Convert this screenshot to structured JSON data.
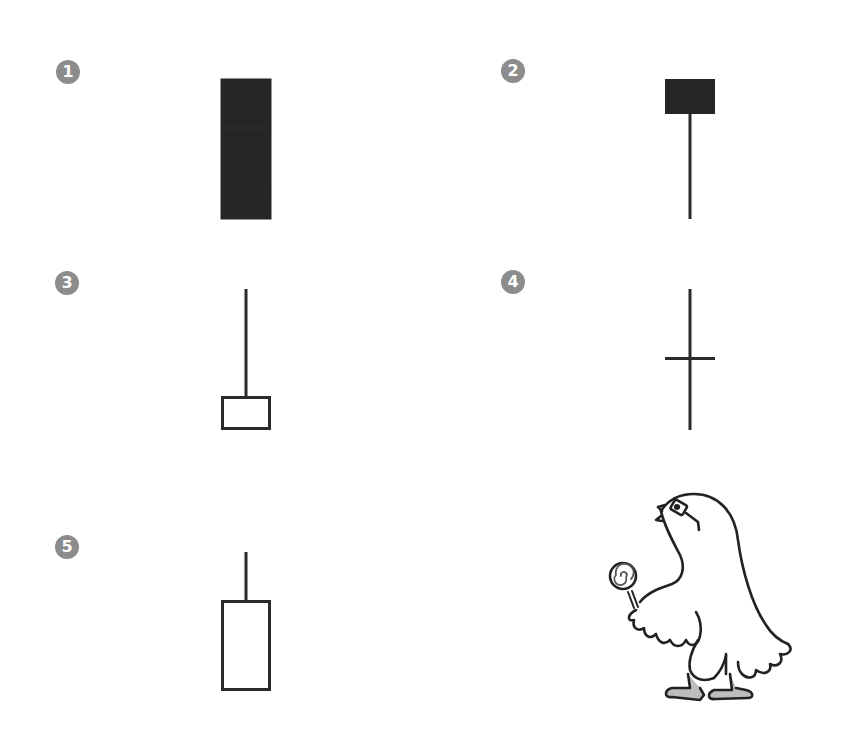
{
  "diagram": {
    "type": "candlestick-patterns",
    "stroke_color": "#2a2a2a",
    "filled_color": "#262626",
    "badge_color": "#8c8c8c",
    "items": [
      {
        "number": "1",
        "kind": "filled-body-no-wicks",
        "badge": {
          "x": 56,
          "y": 60
        },
        "body": {
          "x": 221,
          "y": 79,
          "w": 50,
          "h": 140,
          "filled": true
        },
        "upper_wick": null,
        "lower_wick": null
      },
      {
        "number": "2",
        "kind": "filled-body-long-lower-wick",
        "badge": {
          "x": 501,
          "y": 59
        },
        "body": {
          "x": 665,
          "y": 79,
          "w": 50,
          "h": 35,
          "filled": true
        },
        "upper_wick": null,
        "lower_wick": {
          "x": 690,
          "y1": 114,
          "y2": 219
        }
      },
      {
        "number": "3",
        "kind": "hollow-body-long-upper-wick",
        "badge": {
          "x": 55,
          "y": 271
        },
        "body": {
          "x": 221,
          "y": 396,
          "w": 50,
          "h": 34,
          "filled": false
        },
        "upper_wick": {
          "x": 246,
          "y1": 289,
          "y2": 396
        },
        "lower_wick": null
      },
      {
        "number": "4",
        "kind": "doji-cross",
        "badge": {
          "x": 501,
          "y": 270
        },
        "body": {
          "x": 665,
          "y": 358,
          "w": 50,
          "h": 0,
          "filled": false
        },
        "upper_wick": {
          "x": 690,
          "y1": 289,
          "y2": 358
        },
        "lower_wick": {
          "x": 690,
          "y1": 358,
          "y2": 430
        }
      },
      {
        "number": "5",
        "kind": "hollow-body-short-upper-wick",
        "badge": {
          "x": 55,
          "y": 535
        },
        "body": {
          "x": 221,
          "y": 600,
          "w": 50,
          "h": 91,
          "filled": false
        },
        "upper_wick": {
          "x": 246,
          "y1": 552,
          "y2": 600
        },
        "lower_wick": null
      }
    ],
    "illustration": {
      "subject": "cartoon bird wearing glasses holding a lollipop",
      "icon": "bird-with-lollipop"
    }
  }
}
